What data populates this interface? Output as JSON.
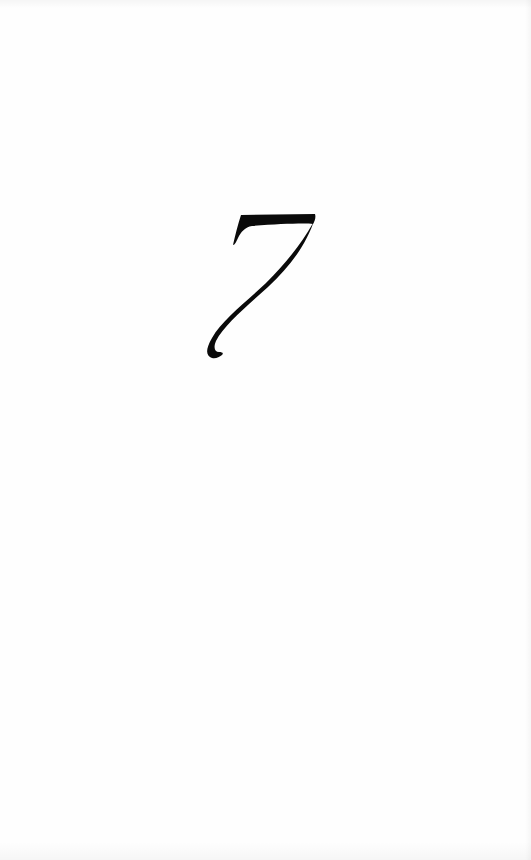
{
  "page": {
    "background_color": "#fefefe",
    "ink_color": "#0a0a0a"
  },
  "chapter": {
    "numeral": "7",
    "numeral_icon": "italic-numeral-seven"
  }
}
